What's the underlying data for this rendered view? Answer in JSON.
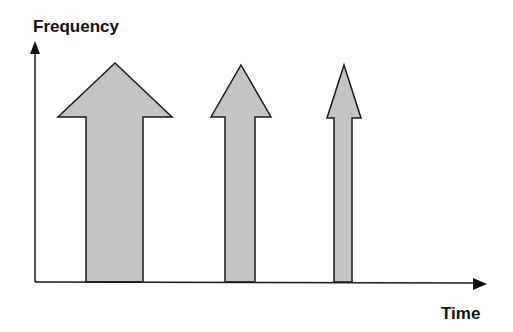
{
  "labels": {
    "y_axis": "Frequency",
    "x_axis": "Time"
  },
  "colors": {
    "fill": "#c4c4c4",
    "stroke": "#1a1a1a"
  },
  "arrows": [
    {
      "name": "arrow-large",
      "tip": [
        115,
        63
      ],
      "head_y": 117,
      "head_left": 58,
      "head_right": 172,
      "shaft_left": 86,
      "shaft_right": 143
    },
    {
      "name": "arrow-medium",
      "tip": [
        241,
        65
      ],
      "head_y": 117,
      "head_left": 211,
      "head_right": 271,
      "shaft_left": 225,
      "shaft_right": 255
    },
    {
      "name": "arrow-small",
      "tip": [
        344,
        65
      ],
      "head_y": 118,
      "head_left": 327,
      "head_right": 361,
      "shaft_left": 334,
      "shaft_right": 352
    }
  ],
  "baseline_y": 282
}
